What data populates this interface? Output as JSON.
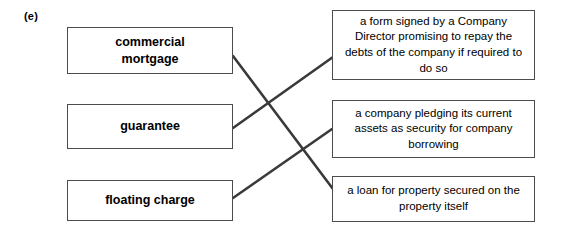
{
  "question": {
    "label": "(e)"
  },
  "colors": {
    "box_border": "#4c4c4c",
    "connector": "#3a3a3a",
    "text": "#000000",
    "background": "#ffffff"
  },
  "diagram": {
    "type": "matching-exercise",
    "left_column": [
      {
        "id": "commercial-mortgage",
        "text": "commercial\nmortgage"
      },
      {
        "id": "guarantee",
        "text": "guarantee"
      },
      {
        "id": "floating-charge",
        "text": "floating charge"
      }
    ],
    "right_column": [
      {
        "id": "guarantee-definition",
        "text": "a form signed by a Company Director promising to repay the debts of the company if required to do so"
      },
      {
        "id": "floating-charge-definition",
        "text": "a company pledging its current assets as security for company borrowing"
      },
      {
        "id": "commercial-mortgage-definition",
        "text": "a loan for property secured on the property itself"
      }
    ],
    "connections": [
      {
        "from": "commercial-mortgage",
        "to": "commercial-mortgage-definition",
        "from_index": 0,
        "to_index": 2,
        "x1": 233,
        "y1": 56,
        "x2": 336,
        "y2": 193
      },
      {
        "from": "guarantee",
        "to": "guarantee-definition",
        "from_index": 1,
        "to_index": 0,
        "x1": 233,
        "y1": 128,
        "x2": 333,
        "y2": 57
      },
      {
        "from": "floating-charge",
        "to": "floating-charge-definition",
        "from_index": 2,
        "to_index": 1,
        "x1": 233,
        "y1": 198,
        "x2": 332,
        "y2": 129
      }
    ]
  }
}
